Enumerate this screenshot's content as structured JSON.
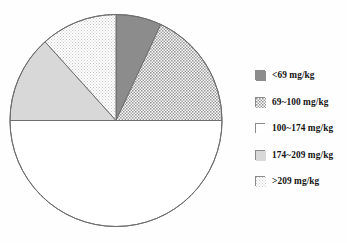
{
  "chart_data": {
    "type": "pie",
    "title": "",
    "subtitle": "",
    "xlabel": "",
    "ylabel": "",
    "grid": false,
    "legend_position": "right",
    "start_angle_deg": 0,
    "direction": "clockwise",
    "center": {
      "x": 116,
      "y": 120.5
    },
    "radius": 106,
    "categories": [
      "<69 mg/kg",
      "69~100 mg/kg",
      "100~174 mg/kg",
      "174~209 mg/kg",
      ">209 mg/kg"
    ],
    "values": [
      7,
      18,
      50,
      13,
      12
    ],
    "units": "percent",
    "slices": [
      {
        "label": "<69 mg/kg",
        "value": 7,
        "start_deg": 0,
        "end_deg": 25,
        "fill_style": "solid-dark-gray",
        "fill_color": "#8c8c8c",
        "stroke_color": "#6e6e6e"
      },
      {
        "label": "69~100 mg/kg",
        "value": 18,
        "start_deg": 25,
        "end_deg": 90,
        "fill_style": "crosshatch-medium-gray",
        "fill_color": "#b4b4b4",
        "stroke_color": "#6e6e6e"
      },
      {
        "label": "100~174 mg/kg",
        "value": 50,
        "start_deg": 90,
        "end_deg": 270,
        "fill_style": "white",
        "fill_color": "#ffffff",
        "stroke_color": "#6e6e6e"
      },
      {
        "label": "174~209 mg/kg",
        "value": 13,
        "start_deg": 270,
        "end_deg": 318,
        "fill_style": "solid-light-gray",
        "fill_color": "#d2d2d2",
        "stroke_color": "#6e6e6e"
      },
      {
        "label": ">209 mg/kg",
        "value": 12,
        "start_deg": 318,
        "end_deg": 360,
        "fill_style": "fine-dotted-very-light-gray",
        "fill_color": "#efefef",
        "stroke_color": "#6e6e6e"
      }
    ]
  },
  "legend": {
    "items": [
      {
        "label": "<69 mg/kg",
        "swatch": "solid-dark-gray-swatch"
      },
      {
        "label": "69~100 mg/kg",
        "swatch": "crosshatch-swatch"
      },
      {
        "label": "100~174 mg/kg",
        "swatch": "white-swatch"
      },
      {
        "label": "174~209 mg/kg",
        "swatch": "solid-light-gray-swatch"
      },
      {
        "label": ">209 mg/kg",
        "swatch": "fine-dotted-swatch"
      }
    ]
  },
  "colors": {
    "slice_dark_gray": "#8c8c8c",
    "slice_hatch_gray": "#b4b4b4",
    "slice_white": "#ffffff",
    "slice_light_gray": "#d2d2d2",
    "slice_very_light_gray": "#efefef",
    "outline": "#6e6e6e",
    "text": "#141414",
    "background": "#fefefe"
  }
}
